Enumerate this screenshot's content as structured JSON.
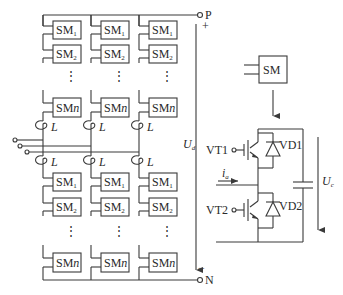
{
  "diagram": {
    "terminals": {
      "positive": "P",
      "negative": "N",
      "plus_sign": "+",
      "minus_sign": "−"
    },
    "dc_voltage": {
      "symbol": "U",
      "subscript": "d"
    },
    "inductor_label": "L",
    "dots": "⋮",
    "submodule_labels": {
      "sm1_base": "SM",
      "sm1_sub": "1",
      "sm2_base": "SM",
      "sm2_sub": "2",
      "smn_base": "SM",
      "smn_sub": "n"
    },
    "detail": {
      "sm_label": "SM",
      "vt1": "VT1",
      "vt2": "VT2",
      "vd1": "VD1",
      "vd2": "VD2",
      "current": {
        "symbol": "i",
        "subscript": "a"
      },
      "cap_voltage": {
        "symbol": "U",
        "subscript": "c"
      }
    },
    "columns": [
      "phase-a",
      "phase-b",
      "phase-c"
    ]
  }
}
